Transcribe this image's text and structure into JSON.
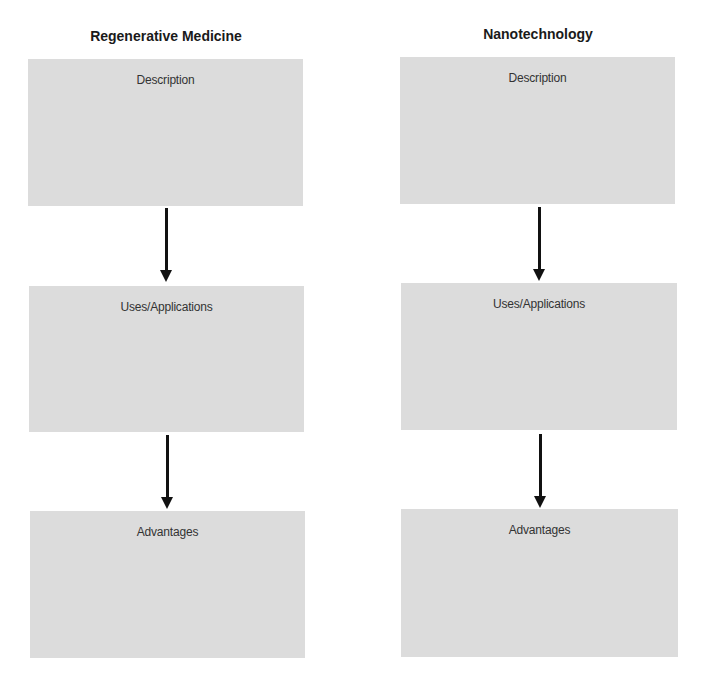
{
  "columns": [
    {
      "title": "Regenerative Medicine",
      "boxes": [
        {
          "label": "Description"
        },
        {
          "label": "Uses/Applications"
        },
        {
          "label": "Advantages"
        }
      ]
    },
    {
      "title": "Nanotechnology",
      "boxes": [
        {
          "label": "Description"
        },
        {
          "label": "Uses/Applications"
        },
        {
          "label": "Advantages"
        }
      ]
    }
  ],
  "colors": {
    "box_fill": "#dcdcdc",
    "arrow": "#111111"
  }
}
